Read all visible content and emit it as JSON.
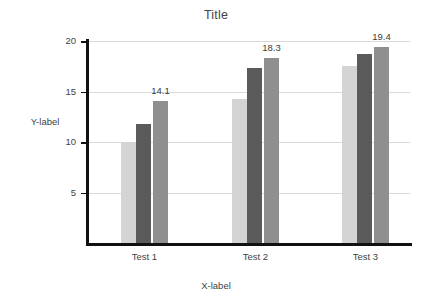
{
  "chart_data": {
    "type": "bar",
    "title": "Title",
    "xlabel": "X-label",
    "ylabel": "Y-label",
    "categories": [
      "Test 1",
      "Test 2",
      "Test 3"
    ],
    "series": [
      {
        "name": "series-1",
        "color": "#d4d4d4",
        "values": [
          10.0,
          14.3,
          17.5
        ]
      },
      {
        "name": "series-2",
        "color": "#5a5a5a",
        "values": [
          11.8,
          17.3,
          18.7
        ]
      },
      {
        "name": "series-3",
        "color": "#8f8f8f",
        "values": [
          14.1,
          18.3,
          19.4
        ]
      }
    ],
    "value_labels": [
      {
        "text": "14.1",
        "group": "Test 1",
        "series": "series-3"
      },
      {
        "text": "18.3",
        "group": "Test 2",
        "series": "series-3"
      },
      {
        "text": "19.4",
        "group": "Test 3",
        "series": "series-3"
      }
    ],
    "yticks": [
      5,
      10,
      15,
      20
    ],
    "ytick_labels": [
      "5",
      "10",
      "15",
      "20"
    ],
    "ylim": [
      0,
      20
    ],
    "grid": true,
    "grid_axis": "y",
    "legend": "none",
    "axis_color": "#111111",
    "grid_color": "#d9d9d9",
    "background": "#ffffff"
  }
}
